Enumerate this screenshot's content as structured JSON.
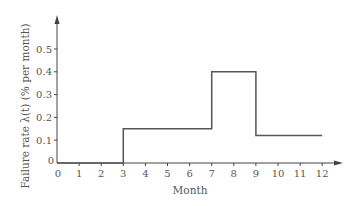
{
  "chart_data": {
    "type": "line",
    "subtype": "step",
    "title": "",
    "xlabel": "Month",
    "ylabel": "Failure rate λ(t) (% per month)",
    "x_ticks": [
      "0",
      "1",
      "2",
      "3",
      "4",
      "5",
      "6",
      "7",
      "8",
      "9",
      "10",
      "11",
      "12"
    ],
    "y_ticks": [
      "0",
      "0.1",
      "0.2",
      "0.3",
      "0.4",
      "0.5"
    ],
    "xlim": [
      0,
      13
    ],
    "ylim": [
      0,
      0.6
    ],
    "grid": false,
    "legend": null,
    "series": [
      {
        "name": "Failure rate",
        "segments": [
          {
            "x_start": 0,
            "x_end": 3,
            "value": 0
          },
          {
            "x_start": 3,
            "x_end": 7,
            "value": 0.15
          },
          {
            "x_start": 7,
            "x_end": 9,
            "value": 0.4
          },
          {
            "x_start": 9,
            "x_end": 12,
            "value": 0.12
          }
        ],
        "x": [
          0,
          3,
          3,
          7,
          7,
          9,
          9,
          12
        ],
        "y": [
          0,
          0,
          0.15,
          0.15,
          0.4,
          0.4,
          0.12,
          0.12
        ]
      }
    ],
    "colors": {
      "line": "#555555",
      "axis": "#444444"
    }
  }
}
